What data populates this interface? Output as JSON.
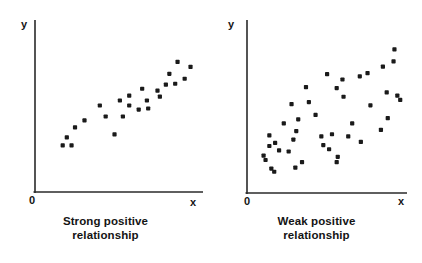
{
  "figure": {
    "title": "",
    "background": "#ffffff",
    "ink": "#1a1a1a"
  },
  "panels": [
    {
      "id": "strong-positive",
      "caption_line1": "Strong positive",
      "caption_line2": "relationship",
      "y_axis_label": "y",
      "x_axis_label": "x",
      "origin_label": "0"
    },
    {
      "id": "weak-positive",
      "caption_line1": "Weak positive",
      "caption_line2": "relationship",
      "y_axis_label": "y",
      "x_axis_label": "x",
      "origin_label": "0"
    }
  ],
  "chart_data": [
    {
      "type": "scatter",
      "title": "Strong positive relationship",
      "xlabel": "x",
      "ylabel": "y",
      "origin_label": "0",
      "grid": false,
      "legend": "none",
      "xlim": [
        0,
        100
      ],
      "ylim": [
        0,
        100
      ],
      "axis_ticks": [],
      "marker": {
        "shape": "square-dot",
        "size_px": 3,
        "color": "#1a1a1a"
      },
      "n_points": 24,
      "points": [
        {
          "x": 13.1,
          "y": 28.9
        },
        {
          "x": 18.7,
          "y": 28.9
        },
        {
          "x": 15.7,
          "y": 34.2
        },
        {
          "x": 20.9,
          "y": 40.8
        },
        {
          "x": 26.9,
          "y": 45.4
        },
        {
          "x": 45.9,
          "y": 36.2
        },
        {
          "x": 51.2,
          "y": 48.0
        },
        {
          "x": 40.3,
          "y": 48.0
        },
        {
          "x": 61.2,
          "y": 52.6
        },
        {
          "x": 55.2,
          "y": 55.3
        },
        {
          "x": 36.6,
          "y": 55.3
        },
        {
          "x": 49.3,
          "y": 58.6
        },
        {
          "x": 67.2,
          "y": 53.3
        },
        {
          "x": 66.4,
          "y": 58.6
        },
        {
          "x": 74.6,
          "y": 61.2
        },
        {
          "x": 55.2,
          "y": 61.8
        },
        {
          "x": 63.4,
          "y": 66.4
        },
        {
          "x": 73.1,
          "y": 65.1
        },
        {
          "x": 78.4,
          "y": 69.1
        },
        {
          "x": 84.3,
          "y": 69.7
        },
        {
          "x": 80.6,
          "y": 76.3
        },
        {
          "x": 90.3,
          "y": 73.0
        },
        {
          "x": 94.0,
          "y": 80.9
        },
        {
          "x": 85.8,
          "y": 84.2
        }
      ]
    },
    {
      "type": "scatter",
      "title": "Weak positive relationship",
      "xlabel": "x",
      "ylabel": "y",
      "origin_label": "0",
      "grid": false,
      "legend": "none",
      "xlim": [
        0,
        100
      ],
      "ylim": [
        0,
        100
      ],
      "axis_ticks": [],
      "marker": {
        "shape": "square-dot",
        "size_px": 3,
        "color": "#1a1a1a"
      },
      "n_points": 43,
      "points": [
        {
          "x": 6.3,
          "y": 20.7
        },
        {
          "x": 7.6,
          "y": 18.0
        },
        {
          "x": 10.1,
          "y": 26.7
        },
        {
          "x": 13.9,
          "y": 28.6
        },
        {
          "x": 11.4,
          "y": 12.7
        },
        {
          "x": 13.3,
          "y": 10.7
        },
        {
          "x": 16.5,
          "y": 24.0
        },
        {
          "x": 10.1,
          "y": 33.3
        },
        {
          "x": 19.6,
          "y": 40.7
        },
        {
          "x": 25.9,
          "y": 30.7
        },
        {
          "x": 22.8,
          "y": 23.3
        },
        {
          "x": 31.6,
          "y": 16.7
        },
        {
          "x": 27.2,
          "y": 13.3
        },
        {
          "x": 24.7,
          "y": 52.7
        },
        {
          "x": 29.1,
          "y": 43.3
        },
        {
          "x": 27.8,
          "y": 36.0
        },
        {
          "x": 34.2,
          "y": 63.3
        },
        {
          "x": 40.5,
          "y": 46.0
        },
        {
          "x": 36.1,
          "y": 54.0
        },
        {
          "x": 44.3,
          "y": 32.7
        },
        {
          "x": 45.6,
          "y": 27.3
        },
        {
          "x": 51.3,
          "y": 34.0
        },
        {
          "x": 49.4,
          "y": 24.7
        },
        {
          "x": 55.1,
          "y": 20.0
        },
        {
          "x": 54.4,
          "y": 16.7
        },
        {
          "x": 58.9,
          "y": 57.3
        },
        {
          "x": 48.1,
          "y": 71.3
        },
        {
          "x": 58.2,
          "y": 68.0
        },
        {
          "x": 54.4,
          "y": 62.7
        },
        {
          "x": 64.6,
          "y": 40.7
        },
        {
          "x": 62.0,
          "y": 32.7
        },
        {
          "x": 70.3,
          "y": 29.3
        },
        {
          "x": 69.6,
          "y": 70.0
        },
        {
          "x": 74.7,
          "y": 72.0
        },
        {
          "x": 76.6,
          "y": 52.0
        },
        {
          "x": 84.8,
          "y": 76.0
        },
        {
          "x": 88.0,
          "y": 44.0
        },
        {
          "x": 87.3,
          "y": 60.0
        },
        {
          "x": 83.5,
          "y": 36.7
        },
        {
          "x": 91.8,
          "y": 79.3
        },
        {
          "x": 94.3,
          "y": 58.0
        },
        {
          "x": 96.2,
          "y": 55.3
        },
        {
          "x": 92.4,
          "y": 86.7
        }
      ]
    }
  ]
}
